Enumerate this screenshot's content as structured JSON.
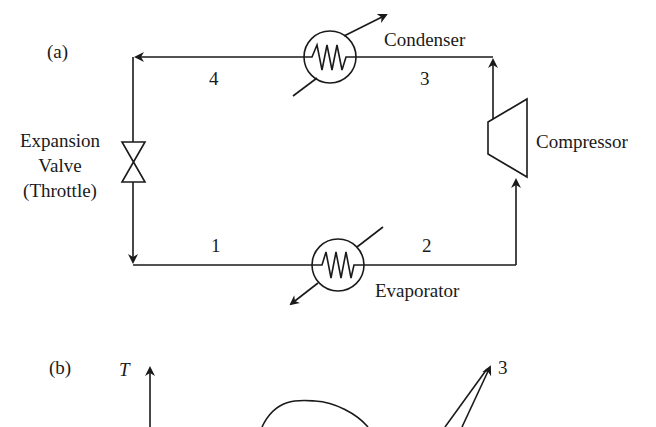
{
  "panel_a": {
    "label": "(a)",
    "components": {
      "condenser": "Condenser",
      "compressor": "Compressor",
      "evaporator": "Evaporator",
      "expansion_valve": [
        "Expansion",
        "Valve",
        "(Throttle)"
      ]
    },
    "states": {
      "s1": "1",
      "s2": "2",
      "s3": "3",
      "s4": "4"
    }
  },
  "panel_b": {
    "label": "(b)",
    "y_axis_label": "T",
    "state_label": "3"
  },
  "colors": {
    "line": "#1a1a1a",
    "background": "#ffffff"
  }
}
